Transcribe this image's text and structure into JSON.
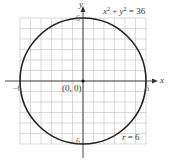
{
  "chart_data": {
    "type": "line",
    "title": "",
    "equation": "x^2 + y^2 = 36",
    "center": [
      0,
      0
    ],
    "radius": 6,
    "xlabel": "x",
    "ylabel": "y",
    "xlim": [
      -6,
      6
    ],
    "ylim": [
      -6,
      6
    ],
    "grid": true,
    "grid_step": 1,
    "annotations": [
      {
        "text": "x² + y² = 36",
        "position": "top-right"
      },
      {
        "text": "(0, 0)",
        "position": "origin"
      },
      {
        "text": "r = 6",
        "position": "bottom-right"
      }
    ],
    "tick_labels": {
      "x_neg": "−6",
      "x_pos": "6",
      "y_pos": "6",
      "y_neg": "−6"
    },
    "series": [
      {
        "name": "circle",
        "shape": "circle",
        "cx": 0,
        "cy": 0,
        "r": 6
      }
    ]
  },
  "labels": {
    "y_axis": "y",
    "x_axis": "x",
    "eq_x": "x",
    "eq_plus": " + ",
    "eq_y": "y",
    "eq_end": " = 36",
    "exp": "2",
    "origin": "(0, 0)",
    "radius_r": "r",
    "radius_val": " = 6",
    "tick_left": "−6",
    "tick_right": "6",
    "tick_top": "6",
    "tick_bottom": "6"
  },
  "colors": {
    "grid": "#c8c8c8",
    "axis": "#333333",
    "circle": "#222222"
  }
}
